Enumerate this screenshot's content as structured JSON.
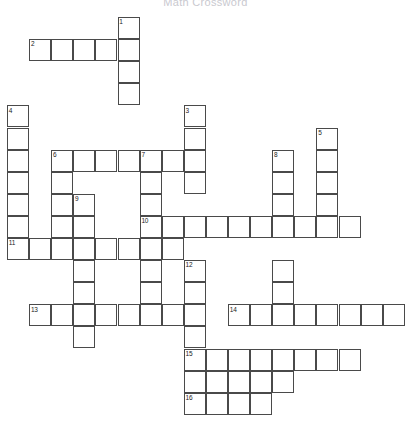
{
  "page": {
    "title": "Math Crossword",
    "background_color": "#ffffff",
    "cell_fill_color": "#ffffff",
    "cell_border_color": "#4a4a4a",
    "number_color": "#222222",
    "title_color": "#c9c9cf"
  },
  "grid": {
    "origin_x": 7,
    "origin_y": 17,
    "cell_size": 22.1,
    "columns": 18,
    "rows": 18
  },
  "entries": {
    "across": [
      {
        "number": "2",
        "row": 1,
        "col": 1,
        "length": 5
      },
      {
        "number": "6",
        "row": 6,
        "col": 2,
        "length": 5
      },
      {
        "number": "7",
        "row": 6,
        "col": 6,
        "length": 4
      },
      {
        "number": "10",
        "row": 9,
        "col": 6,
        "length": 10
      },
      {
        "number": "11",
        "row": 10,
        "col": 0,
        "length": 8
      },
      {
        "number": "13",
        "row": 13,
        "col": 1,
        "length": 8
      },
      {
        "number": "14",
        "row": 13,
        "col": 10,
        "length": 8
      },
      {
        "number": "15",
        "row": 15,
        "col": 8,
        "length": 6
      },
      {
        "number": "16",
        "row": 17,
        "col": 8,
        "length": 4
      }
    ],
    "down": [
      {
        "number": "1",
        "row": 0,
        "col": 5,
        "length": 7
      },
      {
        "number": "3",
        "row": 4,
        "col": 8,
        "length": 4
      },
      {
        "number": "4",
        "row": 4,
        "col": 0,
        "length": 7
      },
      {
        "number": "5",
        "row": 5,
        "col": 14,
        "length": 7
      },
      {
        "number": "6",
        "row": 6,
        "col": 2,
        "length": 6
      },
      {
        "number": "7",
        "row": 6,
        "col": 6,
        "length": 8
      },
      {
        "number": "8",
        "row": 6,
        "col": 12,
        "length": 8
      },
      {
        "number": "9",
        "row": 8,
        "col": 3,
        "length": 7
      },
      {
        "number": "12",
        "row": 11,
        "col": 8,
        "length": 7
      },
      {
        "number": "15",
        "row": 15,
        "col": 8,
        "length": 3
      }
    ]
  },
  "cells": [
    {
      "row": 0,
      "col": 5,
      "number": "1"
    },
    {
      "row": 1,
      "col": 1,
      "number": "2"
    },
    {
      "row": 1,
      "col": 2,
      "number": ""
    },
    {
      "row": 1,
      "col": 3,
      "number": ""
    },
    {
      "row": 1,
      "col": 4,
      "number": ""
    },
    {
      "row": 1,
      "col": 5,
      "number": ""
    },
    {
      "row": 2,
      "col": 5,
      "number": ""
    },
    {
      "row": 3,
      "col": 5,
      "number": ""
    },
    {
      "row": 4,
      "col": 0,
      "number": "4"
    },
    {
      "row": 4,
      "col": 8,
      "number": "3"
    },
    {
      "row": 5,
      "col": 0,
      "number": ""
    },
    {
      "row": 5,
      "col": 8,
      "number": ""
    },
    {
      "row": 5,
      "col": 14,
      "number": "5"
    },
    {
      "row": 6,
      "col": 0,
      "number": ""
    },
    {
      "row": 6,
      "col": 2,
      "number": "6"
    },
    {
      "row": 6,
      "col": 3,
      "number": ""
    },
    {
      "row": 6,
      "col": 4,
      "number": ""
    },
    {
      "row": 6,
      "col": 5,
      "number": ""
    },
    {
      "row": 6,
      "col": 6,
      "number": "7"
    },
    {
      "row": 6,
      "col": 7,
      "number": ""
    },
    {
      "row": 6,
      "col": 8,
      "number": ""
    },
    {
      "row": 6,
      "col": 12,
      "number": "8"
    },
    {
      "row": 6,
      "col": 14,
      "number": ""
    },
    {
      "row": 7,
      "col": 0,
      "number": ""
    },
    {
      "row": 7,
      "col": 2,
      "number": ""
    },
    {
      "row": 7,
      "col": 6,
      "number": ""
    },
    {
      "row": 7,
      "col": 8,
      "number": ""
    },
    {
      "row": 7,
      "col": 12,
      "number": ""
    },
    {
      "row": 7,
      "col": 14,
      "number": ""
    },
    {
      "row": 8,
      "col": 0,
      "number": ""
    },
    {
      "row": 8,
      "col": 2,
      "number": ""
    },
    {
      "row": 8,
      "col": 3,
      "number": "9"
    },
    {
      "row": 8,
      "col": 6,
      "number": ""
    },
    {
      "row": 8,
      "col": 12,
      "number": ""
    },
    {
      "row": 8,
      "col": 14,
      "number": ""
    },
    {
      "row": 9,
      "col": 0,
      "number": ""
    },
    {
      "row": 9,
      "col": 2,
      "number": ""
    },
    {
      "row": 9,
      "col": 3,
      "number": ""
    },
    {
      "row": 9,
      "col": 6,
      "number": "10"
    },
    {
      "row": 9,
      "col": 7,
      "number": ""
    },
    {
      "row": 9,
      "col": 8,
      "number": ""
    },
    {
      "row": 9,
      "col": 9,
      "number": ""
    },
    {
      "row": 9,
      "col": 10,
      "number": ""
    },
    {
      "row": 9,
      "col": 11,
      "number": ""
    },
    {
      "row": 9,
      "col": 12,
      "number": ""
    },
    {
      "row": 9,
      "col": 13,
      "number": ""
    },
    {
      "row": 9,
      "col": 14,
      "number": ""
    },
    {
      "row": 9,
      "col": 15,
      "number": ""
    },
    {
      "row": 10,
      "col": 0,
      "number": "11"
    },
    {
      "row": 10,
      "col": 1,
      "number": ""
    },
    {
      "row": 10,
      "col": 2,
      "number": ""
    },
    {
      "row": 10,
      "col": 3,
      "number": ""
    },
    {
      "row": 10,
      "col": 4,
      "number": ""
    },
    {
      "row": 10,
      "col": 5,
      "number": ""
    },
    {
      "row": 10,
      "col": 6,
      "number": ""
    },
    {
      "row": 10,
      "col": 7,
      "number": ""
    },
    {
      "row": 11,
      "col": 3,
      "number": ""
    },
    {
      "row": 11,
      "col": 6,
      "number": ""
    },
    {
      "row": 11,
      "col": 8,
      "number": "12"
    },
    {
      "row": 11,
      "col": 12,
      "number": ""
    },
    {
      "row": 12,
      "col": 3,
      "number": ""
    },
    {
      "row": 12,
      "col": 6,
      "number": ""
    },
    {
      "row": 12,
      "col": 8,
      "number": ""
    },
    {
      "row": 12,
      "col": 12,
      "number": ""
    },
    {
      "row": 13,
      "col": 1,
      "number": "13"
    },
    {
      "row": 13,
      "col": 2,
      "number": ""
    },
    {
      "row": 13,
      "col": 3,
      "number": ""
    },
    {
      "row": 13,
      "col": 4,
      "number": ""
    },
    {
      "row": 13,
      "col": 5,
      "number": ""
    },
    {
      "row": 13,
      "col": 6,
      "number": ""
    },
    {
      "row": 13,
      "col": 7,
      "number": ""
    },
    {
      "row": 13,
      "col": 8,
      "number": ""
    },
    {
      "row": 13,
      "col": 10,
      "number": "14"
    },
    {
      "row": 13,
      "col": 11,
      "number": ""
    },
    {
      "row": 13,
      "col": 12,
      "number": ""
    },
    {
      "row": 13,
      "col": 13,
      "number": ""
    },
    {
      "row": 13,
      "col": 14,
      "number": ""
    },
    {
      "row": 13,
      "col": 15,
      "number": ""
    },
    {
      "row": 13,
      "col": 16,
      "number": ""
    },
    {
      "row": 13,
      "col": 17,
      "number": ""
    },
    {
      "row": 14,
      "col": 3,
      "number": ""
    },
    {
      "row": 14,
      "col": 8,
      "number": ""
    },
    {
      "row": 15,
      "col": 8,
      "number": "15"
    },
    {
      "row": 15,
      "col": 9,
      "number": ""
    },
    {
      "row": 15,
      "col": 10,
      "number": ""
    },
    {
      "row": 15,
      "col": 11,
      "number": ""
    },
    {
      "row": 15,
      "col": 12,
      "number": ""
    },
    {
      "row": 15,
      "col": 13,
      "number": ""
    },
    {
      "row": 15,
      "col": 14,
      "number": ""
    },
    {
      "row": 15,
      "col": 15,
      "number": ""
    },
    {
      "row": 16,
      "col": 8,
      "number": ""
    },
    {
      "row": 16,
      "col": 9,
      "number": ""
    },
    {
      "row": 16,
      "col": 10,
      "number": ""
    },
    {
      "row": 16,
      "col": 11,
      "number": ""
    },
    {
      "row": 16,
      "col": 12,
      "number": ""
    },
    {
      "row": 17,
      "col": 8,
      "number": "16"
    },
    {
      "row": 17,
      "col": 9,
      "number": ""
    },
    {
      "row": 17,
      "col": 10,
      "number": ""
    },
    {
      "row": 17,
      "col": 11,
      "number": ""
    }
  ]
}
